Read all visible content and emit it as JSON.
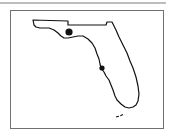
{
  "map": {
    "region": "Florida",
    "outline_color": "#111111",
    "frame_color": "#707070",
    "markers": [
      {
        "name": "marker-north",
        "cx": 69,
        "cy": 32,
        "r": 3.6,
        "color": "#111111"
      },
      {
        "name": "marker-west-coast",
        "cx": 102,
        "cy": 68,
        "r": 2.6,
        "color": "#111111"
      }
    ]
  }
}
